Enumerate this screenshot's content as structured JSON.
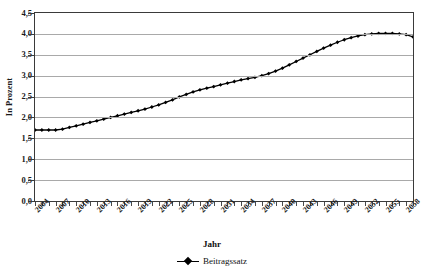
{
  "title_sliver": "· ·· ·",
  "axes": {
    "y_title": "In Prozent",
    "x_title": "Jahr",
    "y_ticks": [
      "4,5",
      "4,0",
      "3,5",
      "3,0",
      "2,5",
      "2,0",
      "1,5",
      "1,0",
      "0,5",
      "0,0"
    ],
    "x_ticks": [
      "2004",
      "2007",
      "2010",
      "2013",
      "2016",
      "2019",
      "2022",
      "2025",
      "2028",
      "2031",
      "2034",
      "2037",
      "2040",
      "2043",
      "2046",
      "2049",
      "2052",
      "2055",
      "2058"
    ]
  },
  "legend": {
    "series_label": "Beitragssatz",
    "marker": "diamond-line-marker"
  },
  "colors": {
    "series": "#000000",
    "grid": "#a9a9a9",
    "frame": "#3a3a3a",
    "background": "#ffffff"
  },
  "chart_data": {
    "type": "line",
    "title": "",
    "xlabel": "Jahr",
    "ylabel": "In Prozent",
    "ylim": [
      0.0,
      4.5
    ],
    "ytick_step": 0.5,
    "xlim": [
      2004,
      2059
    ],
    "grid": true,
    "legend_position": "bottom",
    "marker": "diamond",
    "series": [
      {
        "name": "Beitragssatz",
        "x": [
          2004,
          2005,
          2006,
          2007,
          2008,
          2009,
          2010,
          2011,
          2012,
          2013,
          2014,
          2015,
          2016,
          2017,
          2018,
          2019,
          2020,
          2021,
          2022,
          2023,
          2024,
          2025,
          2026,
          2027,
          2028,
          2029,
          2030,
          2031,
          2032,
          2033,
          2034,
          2035,
          2036,
          2037,
          2038,
          2039,
          2040,
          2041,
          2042,
          2043,
          2044,
          2045,
          2046,
          2047,
          2048,
          2049,
          2050,
          2051,
          2052,
          2053,
          2054,
          2055,
          2056,
          2057,
          2058,
          2059
        ],
        "values": [
          1.7,
          1.7,
          1.7,
          1.7,
          1.72,
          1.76,
          1.8,
          1.84,
          1.88,
          1.92,
          1.96,
          2.0,
          2.04,
          2.08,
          2.12,
          2.16,
          2.2,
          2.25,
          2.3,
          2.36,
          2.42,
          2.49,
          2.55,
          2.61,
          2.66,
          2.7,
          2.74,
          2.78,
          2.82,
          2.86,
          2.9,
          2.93,
          2.96,
          3.0,
          3.05,
          3.11,
          3.18,
          3.26,
          3.34,
          3.42,
          3.5,
          3.58,
          3.66,
          3.73,
          3.8,
          3.86,
          3.91,
          3.95,
          3.98,
          4.0,
          4.01,
          4.01,
          4.01,
          4.0,
          3.98,
          3.93
        ]
      }
    ]
  }
}
